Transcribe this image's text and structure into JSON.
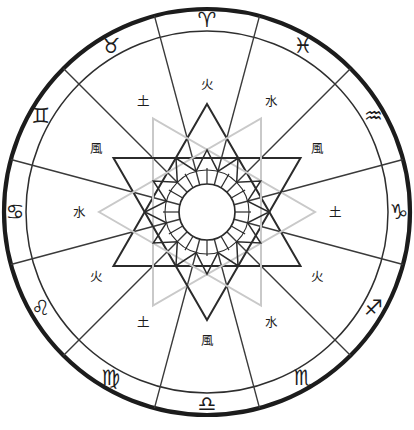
{
  "chart_data": {
    "type": "pie",
    "title": "",
    "subtitle": "",
    "xlabel": "",
    "ylabel": "",
    "legend_position": "none",
    "grid": false,
    "categories": [
      "Aries",
      "Pisces",
      "Aquarius",
      "Capricorn",
      "Sagittarius",
      "Scorpio",
      "Libra",
      "Virgo",
      "Leo",
      "Cancer",
      "Gemini",
      "Taurus"
    ],
    "values": [
      30,
      30,
      30,
      30,
      30,
      30,
      30,
      30,
      30,
      30,
      30,
      30
    ],
    "series": [
      {
        "name": "zodiac_houses",
        "values": [
          30,
          30,
          30,
          30,
          30,
          30,
          30,
          30,
          30,
          30,
          30,
          30
        ]
      }
    ],
    "annotations": [
      "火",
      "水",
      "風",
      "土",
      "火",
      "水",
      "風",
      "土",
      "火",
      "水",
      "風",
      "土"
    ]
  },
  "wheel": {
    "center_x": 207,
    "center_y": 212,
    "outer_radius": 203,
    "sign_ring_inner_radius": 181,
    "element_ring_inner_radius": 46,
    "rosette_outer_radius": 62,
    "rosette_inner_radius": 42,
    "hub_radius": 28,
    "house_count": 12,
    "colors": {
      "outer_stroke": "#1c1c1c",
      "inner_stroke": "#2e2e2e",
      "spoke_stroke": "#3a3a3a",
      "triangle_dark": "#2b2b2b",
      "triangle_light": "#c9c9c9",
      "background": "#ffffff",
      "text": "#1c1c1c"
    }
  },
  "houses": [
    {
      "index": 0,
      "sign_name": "Aries",
      "sign_glyph": "♈",
      "element_glyph": "火",
      "element_name": "fire",
      "angle_deg": 90
    },
    {
      "index": 1,
      "sign_name": "Pisces",
      "sign_glyph": "♓",
      "element_glyph": "水",
      "element_name": "water",
      "angle_deg": 60
    },
    {
      "index": 2,
      "sign_name": "Aquarius",
      "sign_glyph": "♒",
      "element_glyph": "風",
      "element_name": "wind",
      "angle_deg": 30
    },
    {
      "index": 3,
      "sign_name": "Capricorn",
      "sign_glyph": "♑",
      "element_glyph": "土",
      "element_name": "earth",
      "angle_deg": 0
    },
    {
      "index": 4,
      "sign_name": "Sagittarius",
      "sign_glyph": "♐",
      "element_glyph": "火",
      "element_name": "fire",
      "angle_deg": 330
    },
    {
      "index": 5,
      "sign_name": "Scorpio",
      "sign_glyph": "♏",
      "element_glyph": "水",
      "element_name": "water",
      "angle_deg": 300
    },
    {
      "index": 6,
      "sign_name": "Libra",
      "sign_glyph": "♎",
      "element_glyph": "風",
      "element_name": "wind",
      "angle_deg": 270
    },
    {
      "index": 7,
      "sign_name": "Virgo",
      "sign_glyph": "♍",
      "element_glyph": "土",
      "element_name": "earth",
      "angle_deg": 240
    },
    {
      "index": 8,
      "sign_name": "Leo",
      "sign_glyph": "♌",
      "element_glyph": "火",
      "element_name": "fire",
      "angle_deg": 210
    },
    {
      "index": 9,
      "sign_name": "Cancer",
      "sign_glyph": "♋",
      "element_glyph": "水",
      "element_name": "water",
      "angle_deg": 180
    },
    {
      "index": 10,
      "sign_name": "Gemini",
      "sign_glyph": "♊",
      "element_glyph": "風",
      "element_name": "wind",
      "angle_deg": 150
    },
    {
      "index": 11,
      "sign_name": "Taurus",
      "sign_glyph": "♉",
      "element_glyph": "土",
      "element_name": "earth",
      "angle_deg": 120
    }
  ],
  "triangles": [
    {
      "name": "fire-trigon",
      "rotation_deg": 0,
      "tone": "dark",
      "radius": 108
    },
    {
      "name": "earth-trigon",
      "rotation_deg": 30,
      "tone": "light",
      "radius": 108
    },
    {
      "name": "air-trigon",
      "rotation_deg": 60,
      "tone": "dark",
      "radius": 108
    },
    {
      "name": "water-trigon",
      "rotation_deg": 90,
      "tone": "light",
      "radius": 108
    }
  ]
}
